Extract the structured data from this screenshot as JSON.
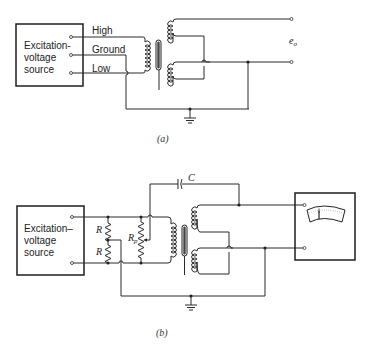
{
  "figure_a": {
    "caption": "(a)",
    "source_label_lines": [
      "Excitation-",
      "voltage",
      "source"
    ],
    "terminals": [
      "High",
      "Ground",
      "Low"
    ],
    "output_label": "e",
    "output_subscript": "o"
  },
  "figure_b": {
    "caption": "(b)",
    "source_label_lines": [
      "Excitation–",
      "voltage",
      "source"
    ],
    "resistor_top": "R",
    "resistor_bottom": "R",
    "potentiometer": "R",
    "potentiometer_subscript": "p",
    "capacitor": "C"
  },
  "colors": {
    "line": "#2a2a2a",
    "background": "#ffffff"
  }
}
